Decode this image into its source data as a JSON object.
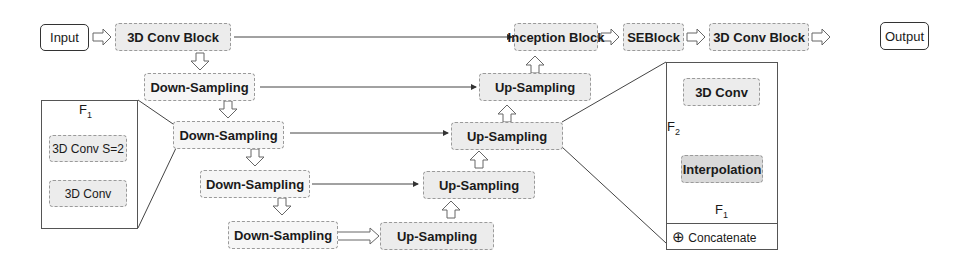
{
  "diagram": {
    "main_flow": {
      "input": "Input",
      "conv_block_1": "3D Conv Block",
      "inception": "Inception Block",
      "seblock": "SEBlock",
      "conv_block_2": "3D Conv Block",
      "output": "Output"
    },
    "encoder": [
      {
        "label": "Down-Sampling"
      },
      {
        "label": "Down-Sampling"
      },
      {
        "label": "Down-Sampling"
      },
      {
        "label": "Down-Sampling"
      }
    ],
    "decoder": [
      {
        "label": "Up-Sampling"
      },
      {
        "label": "Up-Sampling"
      },
      {
        "label": "Up-Sampling"
      },
      {
        "label": "Up-Sampling"
      }
    ],
    "down_detail": {
      "input_label": "F",
      "input_sub": "1",
      "layer1": "3D Conv S=2",
      "layer2": "3D Conv"
    },
    "up_detail": {
      "top": "3D Conv",
      "skip_label": "F",
      "skip_sub": "2",
      "interp": "Interpolation",
      "input_label": "F",
      "input_sub": "1",
      "legend_symbol": "⊕",
      "legend_text": "Concatenate",
      "concat_symbol": "⊕"
    }
  }
}
